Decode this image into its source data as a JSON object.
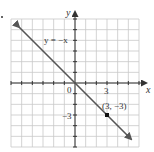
{
  "chart_data": {
    "type": "line",
    "title": "",
    "xlabel": "x",
    "ylabel": "y",
    "xlim": [
      -6,
      6
    ],
    "ylim": [
      -6,
      6
    ],
    "grid": true,
    "origin_label": "0",
    "x_tick_labels": [
      {
        "value": 3,
        "label": "3"
      }
    ],
    "y_tick_labels": [
      {
        "value": -3,
        "label": "-3"
      }
    ],
    "series": [
      {
        "name": "y = -x",
        "equation_label": "y = −x",
        "x": [
          -6,
          6
        ],
        "y": [
          6,
          -6
        ],
        "arrows_both_ends": true,
        "color": "#555555"
      }
    ],
    "points": [
      {
        "x": 3,
        "y": -3,
        "label": "(3, −3)"
      }
    ]
  },
  "labels": {
    "x_axis": "x",
    "y_axis": "y",
    "origin": "0",
    "x_tick_3": "3",
    "y_tick_neg3": "−3",
    "line_equation": "y = −x",
    "point_label": "(3, −3)"
  },
  "colors": {
    "grid": "#c8c8c8",
    "axis": "#333333",
    "line": "#555555",
    "point": "#111111"
  }
}
